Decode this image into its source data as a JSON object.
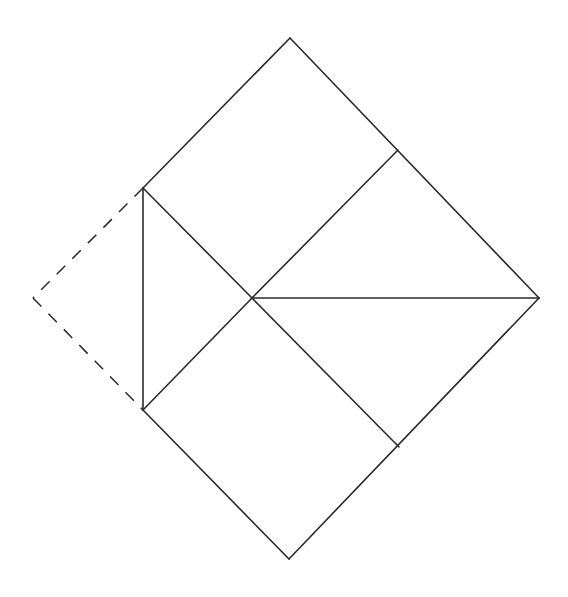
{
  "diagram": {
    "stroke_color": "#2a2a2a",
    "background_color": "#ffffff",
    "points": {
      "top": [
        290,
        38
      ],
      "right": [
        539,
        298
      ],
      "bottom": [
        289,
        559
      ],
      "upper_left": [
        143,
        188
      ],
      "lower_left": [
        143,
        410
      ],
      "center": [
        252,
        298
      ],
      "upper_right_mid": [
        398,
        150
      ],
      "lower_right_mid": [
        399,
        447
      ],
      "dashed_apex": [
        33,
        298
      ]
    },
    "solid_segments": [
      {
        "name": "edge-top-to-right",
        "from": "top",
        "to": "right"
      },
      {
        "name": "edge-right-to-bottom",
        "from": "right",
        "to": "bottom"
      },
      {
        "name": "edge-bottom-to-lower-left",
        "from": "bottom",
        "to": "lower_left"
      },
      {
        "name": "edge-upper-left-to-top",
        "from": "upper_left",
        "to": "top"
      },
      {
        "name": "vertical-left-edge",
        "from": "upper_left",
        "to": "lower_left"
      },
      {
        "name": "diag-upper-left-to-center",
        "from": "upper_left",
        "to": "center"
      },
      {
        "name": "diag-lower-left-to-center",
        "from": "lower_left",
        "to": "center"
      },
      {
        "name": "diag-center-to-upper-right-mid",
        "from": "center",
        "to": "upper_right_mid"
      },
      {
        "name": "diag-center-to-lower-right-mid",
        "from": "center",
        "to": "lower_right_mid"
      },
      {
        "name": "horizontal-center-to-right",
        "from": "center",
        "to": "right"
      }
    ],
    "dashed_segments": [
      {
        "name": "dashed-upper-left-to-apex",
        "from": "upper_left",
        "to": "dashed_apex"
      },
      {
        "name": "dashed-apex-to-lower-left",
        "from": "dashed_apex",
        "to": "lower_left"
      }
    ]
  }
}
